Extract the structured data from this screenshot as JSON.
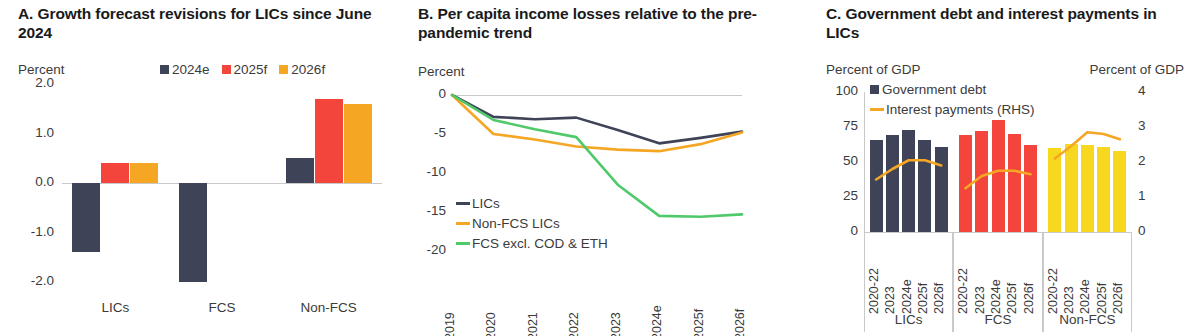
{
  "colors": {
    "navy": "#3e4358",
    "red": "#f4453c",
    "orange": "#f5a623",
    "yellow": "#f7d81e",
    "green": "#4fc96a",
    "grid": "#d9d9d9",
    "text": "#3b3b3b"
  },
  "panel_a": {
    "title": "A. Growth forecast revisions for LICs since June 2024",
    "y_unit": "Percent",
    "legend": [
      {
        "label": "2024e",
        "color": "#3e4358"
      },
      {
        "label": "2025f",
        "color": "#f4453c"
      },
      {
        "label": "2026f",
        "color": "#f5a623"
      }
    ],
    "chart_data": {
      "type": "bar",
      "title": "A. Growth forecast revisions for LICs since June 2024",
      "xlabel": "",
      "ylabel": "Percent",
      "ylim": [
        -2.0,
        2.0
      ],
      "yticks": [
        "2.0",
        "1.0",
        "0.0",
        "-1.0",
        "-2.0"
      ],
      "ytick_values": [
        2.0,
        1.0,
        0.0,
        -1.0,
        -2.0
      ],
      "grid": false,
      "legend_position": "top-right",
      "categories": [
        "LICs",
        "FCS",
        "Non-FCS"
      ],
      "series": [
        {
          "name": "2024e",
          "color": "#3e4358",
          "values": [
            -1.4,
            -2.0,
            0.5
          ]
        },
        {
          "name": "2025f",
          "color": "#f4453c",
          "values": [
            0.4,
            0.0,
            1.7
          ]
        },
        {
          "name": "2026f",
          "color": "#f5a623",
          "values": [
            0.4,
            0.0,
            1.6
          ]
        }
      ]
    }
  },
  "panel_b": {
    "title": "B. Per capita income losses relative to the pre-pandemic trend",
    "y_unit": "Percent",
    "chart_data": {
      "type": "line",
      "title": "B. Per capita income losses relative to the pre-pandemic trend",
      "xlabel": "",
      "ylabel": "Percent",
      "ylim": [
        -20,
        0
      ],
      "yticks": [
        "0",
        "-5",
        "-10",
        "-15",
        "-20"
      ],
      "ytick_values": [
        0,
        -5,
        -10,
        -15,
        -20
      ],
      "grid": false,
      "legend_position": "inside-lower-left",
      "x": [
        "2019",
        "2020",
        "2021",
        "2022",
        "2023",
        "2024e",
        "2025f",
        "2026f"
      ],
      "series": [
        {
          "name": "LICs",
          "color": "#3e4358",
          "values": [
            0,
            -2.8,
            -3.1,
            -2.9,
            -4.5,
            -6.2,
            -5.5,
            -4.7
          ]
        },
        {
          "name": "Non-FCS LICs",
          "color": "#f5a623",
          "values": [
            0,
            -5.0,
            -5.7,
            -6.6,
            -7.0,
            -7.2,
            -6.3,
            -4.8
          ]
        },
        {
          "name": "FCS excl. COD & ETH",
          "color": "#4fc96a",
          "values": [
            0,
            -3.2,
            -4.4,
            -5.4,
            -11.5,
            -15.5,
            -15.6,
            -15.3
          ]
        }
      ]
    }
  },
  "panel_c": {
    "title": "C. Government debt and interest payments in LICs",
    "y_unit_left": "Percent of GDP",
    "y_unit_right": "Percent of GDP",
    "legend": [
      {
        "label": "Government debt",
        "color": "#3e4358",
        "marker": "square"
      },
      {
        "label": "Interest payments (RHS)",
        "color": "#f5a623",
        "marker": "line"
      }
    ],
    "chart_data": {
      "type": "bar",
      "title": "C. Government debt and interest payments in LICs",
      "xlabel": "",
      "ylabel": "Percent of GDP",
      "y2label": "Percent of GDP",
      "ylim": [
        0,
        100
      ],
      "y2lim": [
        0,
        4
      ],
      "yticks": [
        "100",
        "75",
        "50",
        "25",
        "0"
      ],
      "ytick_values": [
        100,
        75,
        50,
        25,
        0
      ],
      "y2ticks": [
        "4",
        "3",
        "2",
        "1",
        "0"
      ],
      "y2tick_values": [
        4,
        3,
        2,
        1,
        0
      ],
      "grid": false,
      "legend_position": "top-center",
      "groups": [
        "LICs",
        "FCS",
        "Non-FCS"
      ],
      "group_colors": [
        "#3e4358",
        "#f4453c",
        "#f7d81e"
      ],
      "categories": [
        "2020-22",
        "2023",
        "2024e",
        "2025f",
        "2026f"
      ],
      "series": [
        {
          "name": "Government debt",
          "axis": "left",
          "type": "bar",
          "data": {
            "LICs": [
              66,
              69,
              73,
              66,
              61
            ],
            "FCS": [
              69,
              72,
              80,
              70,
              62
            ],
            "Non-FCS": [
              60,
              63,
              62,
              61,
              58
            ]
          }
        },
        {
          "name": "Interest payments (RHS)",
          "axis": "right",
          "type": "line",
          "color": "#f5a623",
          "data": {
            "LICs": [
              1.5,
              1.8,
              2.05,
              2.05,
              1.9
            ],
            "FCS": [
              1.25,
              1.6,
              1.75,
              1.75,
              1.65
            ],
            "Non-FCS": [
              2.1,
              2.45,
              2.85,
              2.8,
              2.65
            ]
          }
        }
      ]
    }
  }
}
